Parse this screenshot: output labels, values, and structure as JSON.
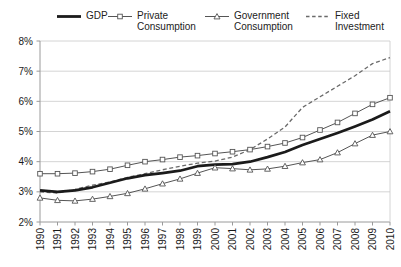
{
  "figure": {
    "background": "#ffffff"
  },
  "legend": {
    "items": [
      {
        "label": "GDP",
        "sample": "thick-solid-line"
      },
      {
        "label": "Private Consumption",
        "sample": "line-with-square-marker"
      },
      {
        "label": "Government Consumption",
        "sample": "line-with-triangle-marker"
      },
      {
        "label": "Fixed Investment",
        "sample": "dashed-line"
      }
    ]
  },
  "chart_data": {
    "type": "line",
    "title": "",
    "xlabel": "",
    "ylabel": "",
    "x": [
      1990,
      1991,
      1992,
      1993,
      1994,
      1995,
      1996,
      1997,
      1998,
      1999,
      2000,
      2001,
      2002,
      2003,
      2004,
      2005,
      2006,
      2007,
      2008,
      2009,
      2010
    ],
    "xtick_labels": [
      "1990",
      "1991",
      "1992",
      "1993",
      "1994",
      "1995",
      "1996",
      "1997",
      "1998",
      "1999",
      "2000",
      "2001",
      "2002",
      "2003",
      "2004",
      "2005",
      "2006",
      "2007",
      "2008",
      "2009",
      "2010"
    ],
    "ylim": [
      2,
      8
    ],
    "ytick_values": [
      2,
      3,
      4,
      5,
      6,
      7,
      8
    ],
    "ytick_labels": [
      "2%",
      "3%",
      "4%",
      "5%",
      "6%",
      "7%",
      "8%"
    ],
    "grid": "horizontal",
    "legend_position": "top",
    "series": [
      {
        "name": "GDP",
        "line": "solid-thick",
        "marker": "none",
        "color": "#1b1b1b",
        "values": [
          3.05,
          3.0,
          3.05,
          3.15,
          3.3,
          3.45,
          3.55,
          3.62,
          3.7,
          3.85,
          3.9,
          3.92,
          4.0,
          4.15,
          4.32,
          4.55,
          4.75,
          4.95,
          5.17,
          5.4,
          5.67
        ]
      },
      {
        "name": "Private Consumption",
        "line": "solid-thin",
        "marker": "square",
        "color": "#555555",
        "values": [
          3.6,
          3.6,
          3.62,
          3.67,
          3.75,
          3.88,
          4.0,
          4.07,
          4.15,
          4.2,
          4.27,
          4.33,
          4.4,
          4.5,
          4.62,
          4.8,
          5.05,
          5.3,
          5.6,
          5.9,
          6.12
        ]
      },
      {
        "name": "Government Consumption",
        "line": "solid-thin",
        "marker": "triangle",
        "color": "#555555",
        "values": [
          2.8,
          2.72,
          2.7,
          2.76,
          2.85,
          2.95,
          3.1,
          3.27,
          3.43,
          3.62,
          3.8,
          3.77,
          3.73,
          3.76,
          3.85,
          3.97,
          4.07,
          4.3,
          4.6,
          4.88,
          5.0
        ]
      },
      {
        "name": "Fixed Investment",
        "line": "dashed",
        "marker": "none",
        "color": "#6a6a6a",
        "values": [
          3.0,
          2.96,
          3.08,
          3.22,
          3.33,
          3.48,
          3.6,
          3.73,
          3.85,
          3.95,
          4.02,
          4.15,
          4.4,
          4.75,
          5.15,
          5.8,
          6.15,
          6.5,
          6.85,
          7.25,
          7.45
        ]
      }
    ],
    "colors": {
      "gridline": "#c9c9c9",
      "axis": "#9a9a9a",
      "text": "#1a1a1a"
    }
  }
}
